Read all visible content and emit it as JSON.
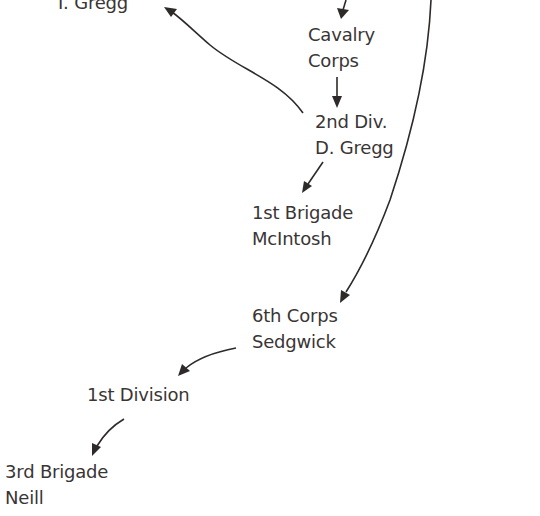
{
  "diagram": {
    "type": "organizational-hierarchy",
    "nodes": [
      {
        "id": "i-gregg",
        "lines": [
          "I. Gregg"
        ]
      },
      {
        "id": "cavalry-corps",
        "lines": [
          "Cavalry",
          "Corps"
        ]
      },
      {
        "id": "2nd-div",
        "lines": [
          "2nd Div.",
          "D. Gregg"
        ]
      },
      {
        "id": "1st-brigade",
        "lines": [
          "1st Brigade",
          "McIntosh"
        ]
      },
      {
        "id": "6th-corps",
        "lines": [
          "6th Corps",
          "Sedgwick"
        ]
      },
      {
        "id": "1st-division",
        "lines": [
          "1st Division"
        ]
      },
      {
        "id": "3rd-brigade",
        "lines": [
          "3rd Brigade",
          "Neill"
        ]
      }
    ],
    "edges": [
      {
        "from": "(above, off-screen)",
        "to": "cavalry-corps"
      },
      {
        "from": "cavalry-corps",
        "to": "2nd-div"
      },
      {
        "from": "2nd-div",
        "to": "i-gregg"
      },
      {
        "from": "2nd-div",
        "to": "1st-brigade"
      },
      {
        "from": "(above, off-screen)",
        "to": "6th-corps"
      },
      {
        "from": "6th-corps",
        "to": "1st-division"
      },
      {
        "from": "1st-division",
        "to": "3rd-brigade"
      }
    ],
    "colors": {
      "text": "#3a3535",
      "arrow": "#2e2a2a",
      "background": "#ffffff"
    }
  }
}
